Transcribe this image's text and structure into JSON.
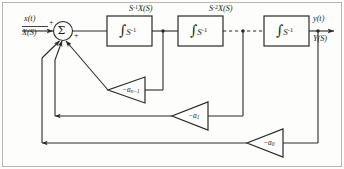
{
  "diagram": {
    "input": {
      "time_label": "x(t)",
      "laplace_label": "X(S)"
    },
    "output": {
      "time_label": "y(t)",
      "laplace_label": "Y(S)"
    },
    "summer": {
      "glyph": "Σ",
      "sign_input": "+",
      "sign_forward": "+",
      "sign_feedback": "+"
    },
    "integrators": [
      {
        "id": "integrator-1",
        "integral_glyph": "∫",
        "operator": "S",
        "exponent": "-1"
      },
      {
        "id": "integrator-2",
        "integral_glyph": "∫",
        "operator": "S",
        "exponent": "-1"
      },
      {
        "id": "integrator-3",
        "integral_glyph": "∫",
        "operator": "S",
        "exponent": "-1"
      }
    ],
    "signals": [
      {
        "id": "signal-after-first-integrator",
        "operator": "S",
        "exponent": "-1",
        "variable": "X(S)"
      },
      {
        "id": "signal-after-second-integrator",
        "operator": "S",
        "exponent": "-2",
        "variable": "X(S)"
      }
    ],
    "gains": [
      {
        "id": "gain-a-n-minus-1",
        "sign": "−",
        "symbol": "a",
        "subscript": "n−1"
      },
      {
        "id": "gain-a-1",
        "sign": "−",
        "symbol": "a",
        "subscript": "1"
      },
      {
        "id": "gain-a-0",
        "sign": "−",
        "symbol": "a",
        "subscript": "0"
      }
    ],
    "colors": {
      "line": "#2a2a2a",
      "background": "#fdfdfc",
      "border": "#b9b7b2",
      "text": "#1b1b1b"
    }
  }
}
